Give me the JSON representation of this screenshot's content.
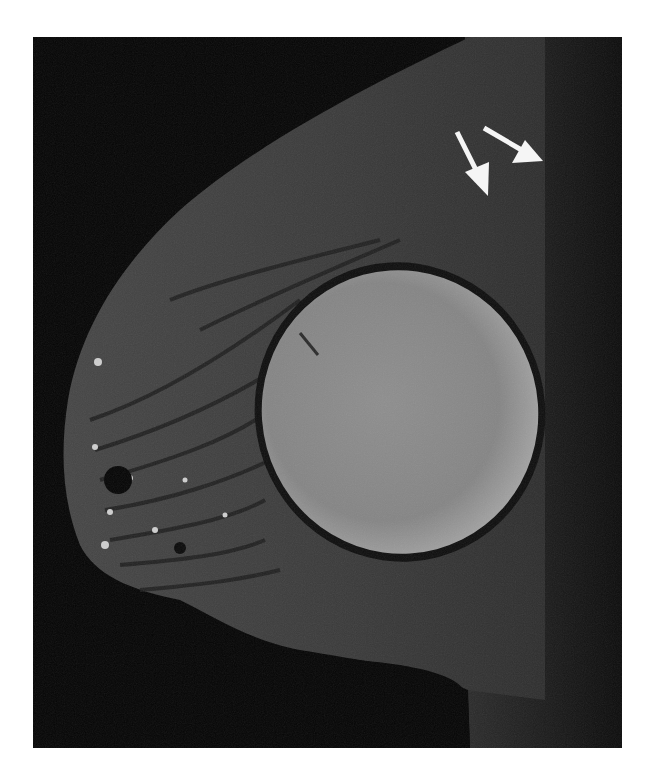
{
  "image": {
    "type": "sagittal breast MRI",
    "description": "Breast MRI showing a silicone/saline implant with surrounding fibroglandular tissue; two white arrows pointing to a region near the upper chest wall",
    "colors": {
      "background": "#050505",
      "soft_tissue": "#3c3c3c",
      "implant": "#8c8c8c",
      "chest_wall_strip": "#1a1a1a",
      "arrow": "#f5f5f5",
      "page": "#ffffff"
    },
    "annotations": [
      {
        "type": "arrow",
        "label": "arrow-1",
        "from": [
          457,
          132
        ],
        "to": [
          488,
          196
        ]
      },
      {
        "type": "arrow",
        "label": "arrow-2",
        "from": [
          484,
          128
        ],
        "to": [
          543,
          161
        ]
      }
    ]
  }
}
